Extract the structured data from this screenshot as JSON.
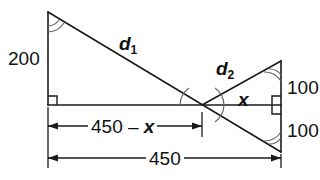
{
  "figure": {
    "stroke_color": "#1a1a1a",
    "background_color": "#ffffff",
    "arc_color": "#555555"
  },
  "labels": {
    "left_height": "200",
    "hypotenuse_1": "d",
    "hypotenuse_1_subscript": "1",
    "hypotenuse_2": "d",
    "hypotenuse_2_subscript": "2",
    "angle_x": "x",
    "right_height_top": "100",
    "right_height_bottom": "100",
    "dimension_partial_prefix": "450 – ",
    "dimension_partial_variable": "x",
    "dimension_total": "450"
  },
  "geometry": {
    "apex_top_left": [
      48,
      12
    ],
    "corner_bottom_left": [
      48,
      105
    ],
    "intersection": [
      202,
      105
    ],
    "apex_top_right": [
      281,
      61
    ],
    "apex_bottom_right": [
      281,
      152
    ],
    "baseline_y": 105,
    "dimension_line_partial_y": 126,
    "dimension_line_total_y": 158
  },
  "markers": {
    "right_angle_bottom_left": true,
    "right_angle_right_side": true,
    "angle_arc_top_left": true,
    "angle_arc_top_right": true,
    "angle_arc_bottom_right": true,
    "angle_arc_intersection_left": true,
    "angle_arc_intersection_right": true
  }
}
